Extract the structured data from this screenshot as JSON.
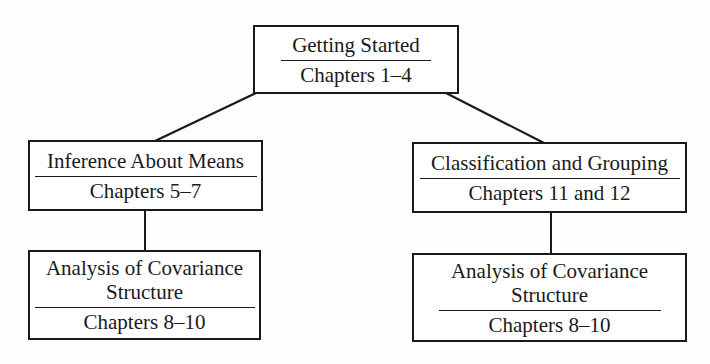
{
  "diagram": {
    "type": "hierarchy",
    "nodes": [
      {
        "id": "getting-started",
        "title": "Getting Started",
        "chapters": "Chapters 1–4"
      },
      {
        "id": "inference-about-means",
        "title": "Inference About Means",
        "chapters": "Chapters 5–7"
      },
      {
        "id": "classification-and-grouping",
        "title": "Classification and Grouping",
        "chapters": "Chapters 11 and 12"
      },
      {
        "id": "analysis-of-covariance-left",
        "title_line1": "Analysis of Covariance",
        "title_line2": "Structure",
        "chapters": "Chapters 8–10"
      },
      {
        "id": "analysis-of-covariance-right",
        "title_line1": "Analysis of Covariance",
        "title_line2": "Structure",
        "chapters": "Chapters 8–10"
      }
    ],
    "edges": [
      {
        "from": "getting-started",
        "to": "inference-about-means"
      },
      {
        "from": "getting-started",
        "to": "classification-and-grouping"
      },
      {
        "from": "inference-about-means",
        "to": "analysis-of-covariance-left"
      },
      {
        "from": "classification-and-grouping",
        "to": "analysis-of-covariance-right"
      }
    ],
    "colors": {
      "line": "#1a1a1a",
      "background": "#fdfdfd"
    }
  }
}
